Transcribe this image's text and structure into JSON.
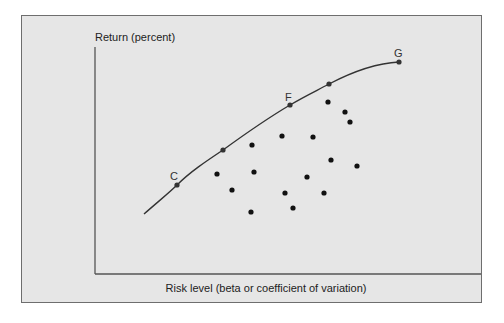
{
  "chart_data": {
    "type": "scatter",
    "title": "",
    "ylabel": "Return (percent)",
    "xlabel": "Risk level (beta or coefficient of variation)",
    "grid": false,
    "legend": null,
    "frontier": {
      "name": "Efficient frontier",
      "labeled_points": [
        {
          "label": "C",
          "x": 177,
          "y": 185
        },
        {
          "label": "F",
          "x": 290,
          "y": 105
        },
        {
          "label": "G",
          "x": 399,
          "y": 62
        }
      ],
      "unlabeled_points": [
        {
          "x": 223,
          "y": 150
        },
        {
          "x": 329,
          "y": 84
        }
      ],
      "start": {
        "x": 144,
        "y": 214
      }
    },
    "portfolios": [
      {
        "x": 328,
        "y": 102
      },
      {
        "x": 345,
        "y": 112
      },
      {
        "x": 350,
        "y": 122
      },
      {
        "x": 282,
        "y": 136
      },
      {
        "x": 313,
        "y": 137
      },
      {
        "x": 252,
        "y": 145
      },
      {
        "x": 331,
        "y": 160
      },
      {
        "x": 357,
        "y": 166
      },
      {
        "x": 217,
        "y": 174
      },
      {
        "x": 254,
        "y": 172
      },
      {
        "x": 307,
        "y": 177
      },
      {
        "x": 232,
        "y": 190
      },
      {
        "x": 285,
        "y": 193
      },
      {
        "x": 324,
        "y": 193
      },
      {
        "x": 293,
        "y": 208
      },
      {
        "x": 251,
        "y": 212
      }
    ]
  },
  "labels": {
    "y_axis": "Return (percent)",
    "x_axis": "Risk level (beta or coefficient of variation)",
    "point_c": "C",
    "point_f": "F",
    "point_g": "G"
  },
  "colors": {
    "panel_bg": "#e6e6e6",
    "border": "#6e6e6e",
    "ink": "#222222"
  }
}
